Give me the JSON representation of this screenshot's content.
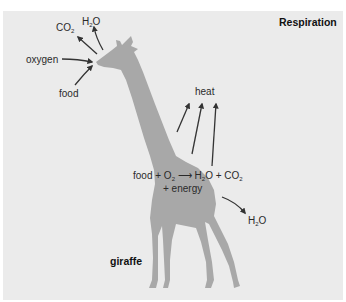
{
  "title": "Respiration",
  "animal_label": "giraffe",
  "inputs": {
    "oxygen": "oxygen",
    "food": "food"
  },
  "outputs_head": {
    "co2": {
      "main": "CO",
      "sub": "2"
    },
    "h2o": {
      "main": "H",
      "sub": "2",
      "rest": "O"
    }
  },
  "heat_label": "heat",
  "equation": {
    "food": "food + O",
    "o2_sub": "2",
    "arrow": "⟶",
    "h": "H",
    "h_sub": "2",
    "o_co": "O + CO",
    "co2_sub": "2",
    "line2": "+ energy"
  },
  "output_body": {
    "main": "H",
    "sub": "2",
    "rest": "O"
  },
  "colors": {
    "panel_bg": "#ebebeb",
    "giraffe_fill": "#a8a8a8",
    "arrow": "#333333",
    "text": "#2a2a2a"
  }
}
